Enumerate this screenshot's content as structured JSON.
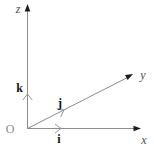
{
  "diagram": {
    "origin_label": "O",
    "axes": [
      {
        "name": "z-axis",
        "label": "z",
        "direction": "up"
      },
      {
        "name": "y-axis",
        "label": "y",
        "direction": "up-right"
      },
      {
        "name": "x-axis",
        "label": "x",
        "direction": "right"
      }
    ],
    "unit_vectors": [
      {
        "name": "k",
        "label": "k",
        "along_axis": "z"
      },
      {
        "name": "j",
        "label": "j",
        "along_axis": "y"
      },
      {
        "name": "i",
        "label": "i",
        "along_axis": "x"
      }
    ],
    "colors": {
      "background": "#ffffff",
      "axis_line": "#8c8c8c",
      "axis_arrowhead": "#1a1a1a",
      "unit_vector_chevron": "#9a9a9a",
      "axis_label": "#4d4d4d",
      "vector_label": "#141414",
      "origin_label": "#8a8a8a"
    }
  }
}
